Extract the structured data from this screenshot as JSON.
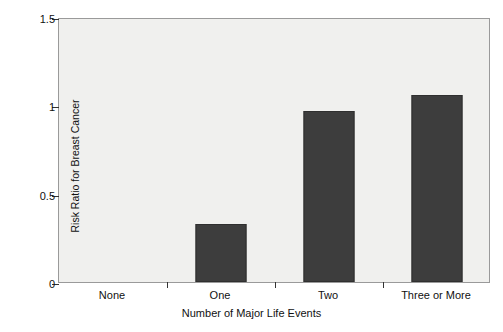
{
  "chart_data": {
    "type": "bar",
    "title": "",
    "xlabel": "Number of Major Life Events",
    "ylabel": "Risk Ratio for Breast Cancer",
    "categories": [
      "None",
      "One",
      "Two",
      "Three or More"
    ],
    "values": [
      0,
      0.33,
      0.97,
      1.06
    ],
    "ylim": [
      0,
      1.5
    ],
    "yticks": [
      "0",
      "0.5",
      "1",
      "1.5"
    ],
    "ytick_values": [
      0,
      0.5,
      1,
      1.5
    ],
    "grid": false,
    "legend": "none",
    "colors": {
      "bar": "#3d3d3d",
      "plot_background": "#f0f0ee",
      "figure_background": "#ffffff",
      "axis": "#333333",
      "text": "#111111"
    }
  }
}
